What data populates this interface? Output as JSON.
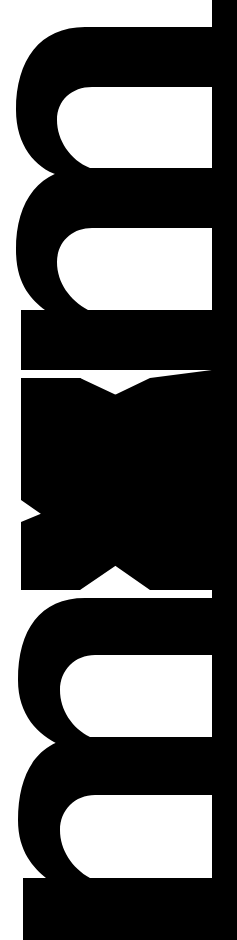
{
  "logo": {
    "text": "mxm",
    "orientation": "rotated 90° clockwise, reading top-to-bottom",
    "fill_color": "#000000",
    "background_color": "#ffffff"
  }
}
